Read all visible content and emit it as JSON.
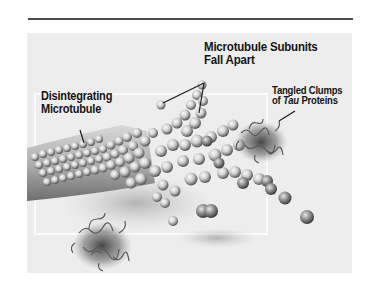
{
  "figure": {
    "labels": {
      "subunits_line1": "Microtubule Subunits",
      "subunits_line2": "Fall Apart",
      "disintegrating_line1": "Disintegrating",
      "disintegrating_line2": "Microtubule",
      "tangled_line1": "Tangled Clumps",
      "tangled_line2_prefix": "of ",
      "tangled_line2_italic": "Tau",
      "tangled_line2_suffix": " Proteins"
    },
    "colors": {
      "background": "#ececec",
      "rule": "#4a4a4a",
      "sphere_light": "#f4f4f4",
      "sphere_dark": "#555555",
      "text": "#141414"
    }
  }
}
